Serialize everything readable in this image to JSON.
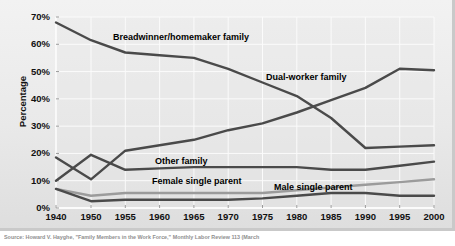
{
  "figure": {
    "caption": "Source: Howard V. Hayghe, \"Family Members in the Work Force,\" Monthly Labor Review 113 (March"
  },
  "chart_data": {
    "type": "line",
    "title": "",
    "xlabel": "",
    "ylabel": "Percentage",
    "grid": true,
    "legend_position": "inline-labels",
    "xlim": [
      1940,
      2000
    ],
    "ylim": [
      0,
      70
    ],
    "x": [
      1940,
      1950,
      1955,
      1960,
      1965,
      1970,
      1975,
      1980,
      1985,
      1990,
      1995,
      2000
    ],
    "categories": [
      "1940",
      "1950",
      "1955",
      "1960",
      "1965",
      "1970",
      "1975",
      "1980",
      "1985",
      "1990",
      "1995",
      "2000"
    ],
    "ytick_labels": [
      "0%",
      "10%",
      "20%",
      "30%",
      "40%",
      "50%",
      "60%",
      "70%"
    ],
    "ytick_values": [
      0,
      10,
      20,
      30,
      40,
      50,
      60,
      70
    ],
    "series": [
      {
        "name": "Breadwinner/homemaker family",
        "color": "#4a4a4a",
        "label_x": 113,
        "label_y": 32,
        "values": [
          68,
          61.5,
          57,
          56,
          55,
          51,
          46,
          41,
          33,
          22,
          22.5,
          23
        ]
      },
      {
        "name": "Dual-worker family",
        "color": "#4a4a4a",
        "label_x": 266,
        "label_y": 72,
        "values": [
          18.5,
          10.5,
          21,
          23,
          25,
          28.5,
          31,
          35,
          39.5,
          44,
          51,
          50.5
        ]
      },
      {
        "name": "Other family",
        "color": "#4a4a4a",
        "label_x": 155,
        "label_y": 156,
        "values": [
          10,
          19.5,
          14,
          14.5,
          15,
          15,
          15,
          15,
          14,
          14,
          15.5,
          17
        ]
      },
      {
        "name": "Female single parent",
        "color": "#9b9b9b",
        "label_x": 152,
        "label_y": 176,
        "values": [
          7,
          4.5,
          5.5,
          5.5,
          5.5,
          5.5,
          5.5,
          6.5,
          7.5,
          8.5,
          9.5,
          10.5
        ]
      },
      {
        "name": "Male single parent",
        "color": "#4a4a4a",
        "label_x": 274,
        "label_y": 182,
        "values": [
          7,
          2.5,
          3,
          3,
          3,
          3,
          3.5,
          4.5,
          5.5,
          5.5,
          4.5,
          4.5
        ]
      }
    ]
  }
}
